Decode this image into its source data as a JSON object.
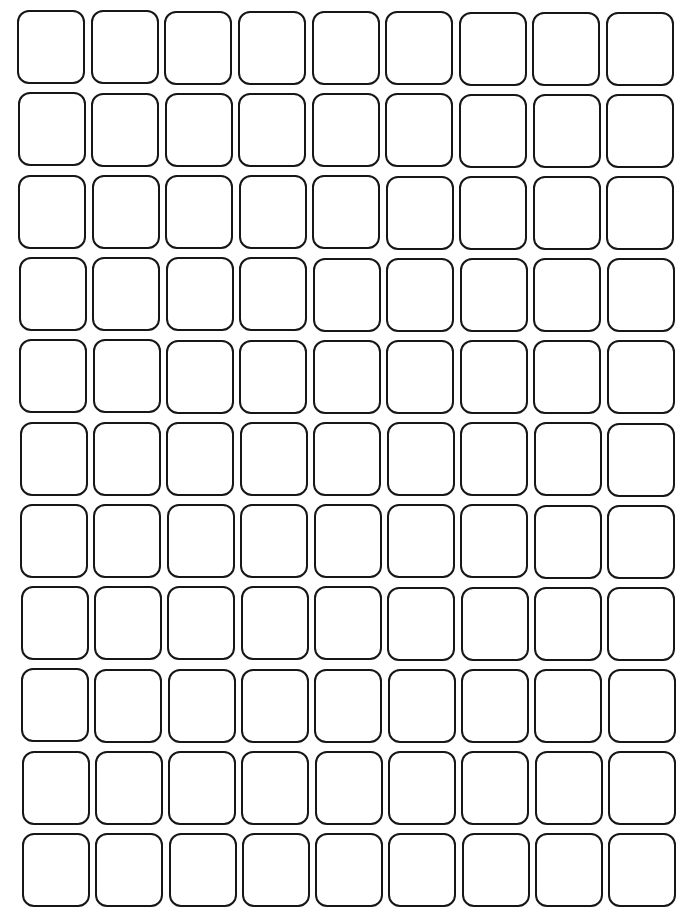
{
  "grid": {
    "rows": 11,
    "columns": 9,
    "cell_width": 68,
    "cell_height": 74,
    "origin_top_left": [
      17,
      10
    ],
    "origin_top_right": [
      606,
      12
    ],
    "origin_bottom_left": [
      22,
      833
    ],
    "origin_bottom_right": [
      608,
      833
    ],
    "border_color": "#161616",
    "fill_color": "#ffffff",
    "corner_radius": 12,
    "cells_content": "empty"
  }
}
